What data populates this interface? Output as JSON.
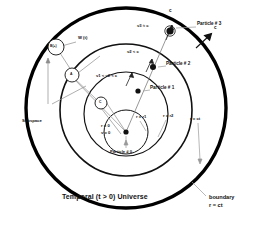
{
  "figure": {
    "caption": "Temporal (t > 0) Universe",
    "boundary_label_line1": "boundary",
    "boundary_label_line2": "r = ct"
  },
  "circles": {
    "outer_label": "r = ct",
    "mid_label": "r = r2",
    "inner_label": "r = r1",
    "center_radius_label": "r = 0",
    "center_velocity_label": "v = 0"
  },
  "particles": [
    {
      "name": "Particle # 0",
      "velocity_label": "",
      "radius_label": "r = 0"
    },
    {
      "name": "Particle # 1",
      "velocity_label": "v1 < v2 < c",
      "radius_label": "r = r1"
    },
    {
      "name": "Particle # 2",
      "velocity_label": "v2 < c",
      "radius_label": "r = r2"
    },
    {
      "name": "Particle # 3",
      "velocity_label": "v3 ≈ c",
      "radius_label": "r = ct"
    }
  ],
  "light_speed": {
    "arrow_label_top": "c",
    "arrow_label_right": "c"
  },
  "subspace": {
    "label": "Subspace",
    "node_w_label": "W (t)",
    "node_a_text": "B(+)",
    "node_b_text": "A",
    "node_c_text": "C"
  },
  "colors": {
    "ink": "#111111",
    "line": "#9a9a9a",
    "boundary": "#000000"
  }
}
